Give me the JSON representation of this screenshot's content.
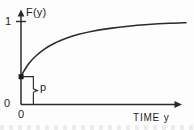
{
  "figure": {
    "background_color": "#fdfdfd",
    "ink_color": "#2b2b2b",
    "width": 194,
    "height": 130
  },
  "axes": {
    "y_axis_title": "F(y)",
    "x_axis_title": "TIME  y",
    "y_tick_one_label": "1",
    "y_origin_label": "0",
    "x_origin_label": "0"
  },
  "annotations": {
    "jump_bracket_label": "p"
  },
  "chart_data": {
    "type": "line",
    "title": "",
    "subtitle": "",
    "xlabel": "TIME  y",
    "ylabel": "F(y)",
    "xlim": [
      0,
      1
    ],
    "ylim": [
      0,
      1.08
    ],
    "grid": false,
    "legend": null,
    "axis_style": "arrowed",
    "tick_labels": {
      "y": [
        "0",
        "1"
      ],
      "x": [
        "0"
      ]
    },
    "series": [
      {
        "name": "F(y)",
        "description": "Cumulative distribution function with an initial jump of size p at y=0, rising asymptotically toward 1",
        "x": [
          0.0,
          0.02,
          0.05,
          0.09,
          0.14,
          0.2,
          0.27,
          0.35,
          0.44,
          0.54,
          0.65,
          0.77,
          0.9,
          1.0
        ],
        "y": [
          0.335,
          0.41,
          0.5,
          0.585,
          0.665,
          0.735,
          0.795,
          0.845,
          0.885,
          0.917,
          0.943,
          0.963,
          0.978,
          0.985
        ]
      }
    ],
    "markers": [
      {
        "name": "jump-start-point",
        "x": 0.0,
        "y": 0.335,
        "style": "filled-square"
      }
    ],
    "annotations": [
      {
        "name": "jump-bracket",
        "label": "p",
        "from_y": 0.0,
        "to_y": 0.335,
        "at_x": 0.075,
        "description": "Brace measuring the probability mass p of the jump at the origin"
      }
    ]
  }
}
